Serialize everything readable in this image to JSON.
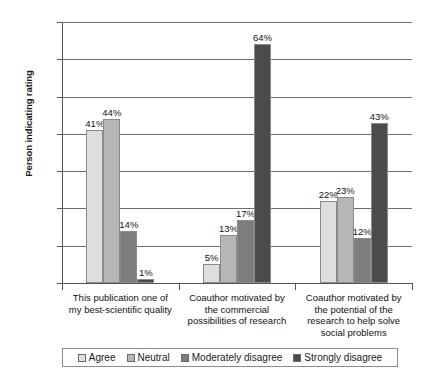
{
  "chart_data": {
    "type": "bar",
    "title": "",
    "xlabel": "",
    "ylabel": "Person indicating rating",
    "ylim": [
      0,
      70
    ],
    "ytick_labels": [
      "0%",
      "10%",
      "20%",
      "30%",
      "40%",
      "50%",
      "60%",
      "70%"
    ],
    "ytick_values": [
      0,
      10,
      20,
      30,
      40,
      50,
      60,
      70
    ],
    "grid": true,
    "legend_position": "bottom",
    "categories": [
      "This publication one of my best-scientific quality",
      "Coauthor motivated by the commercial possibilities of research",
      "Coauthor motivated by the potential of the research to help solve social problems"
    ],
    "category_lines": [
      [
        "This publication one of",
        "my best-scientific quality"
      ],
      [
        "Coauthor motivated by",
        "the commercial",
        "possibilities of research"
      ],
      [
        "Coauthor motivated by",
        "the potential of the",
        "research to help solve",
        "social problems"
      ]
    ],
    "series": [
      {
        "name": "Agree",
        "color": "#dededc",
        "values": [
          41,
          5,
          22
        ],
        "labels": [
          "41%",
          "5%",
          "22%"
        ]
      },
      {
        "name": "Neutral",
        "color": "#b6b6b4",
        "values": [
          44,
          13,
          23
        ],
        "labels": [
          "44%",
          "13%",
          "23%"
        ]
      },
      {
        "name": "Moderately disagree",
        "color": "#7d7d7b",
        "values": [
          14,
          17,
          12
        ],
        "labels": [
          "14%",
          "17%",
          "12%"
        ]
      },
      {
        "name": "Strongly disagree",
        "color": "#4b4b4a",
        "values": [
          1,
          64,
          43
        ],
        "labels": [
          "1%",
          "64%",
          "43%"
        ]
      }
    ]
  },
  "legend": {
    "items": [
      {
        "label": "Agree",
        "color": "#dededc"
      },
      {
        "label": "Neutral",
        "color": "#b6b6b4"
      },
      {
        "label": "Moderately disagree",
        "color": "#7d7d7b"
      },
      {
        "label": "Strongly disagree",
        "color": "#4b4b4a"
      }
    ]
  }
}
